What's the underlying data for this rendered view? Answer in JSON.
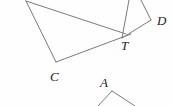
{
  "figure": {
    "width": 173,
    "height": 106,
    "background_color": "#fefefe",
    "stroke_color": "#7b7b7b",
    "label_color": "#1b1b1b",
    "stroke_width": 1,
    "labels": [
      {
        "id": "C",
        "text": "C",
        "x": 50,
        "y": 70
      },
      {
        "id": "T",
        "text": "T",
        "x": 121,
        "y": 39
      },
      {
        "id": "D",
        "text": "D",
        "x": 157,
        "y": 14
      },
      {
        "id": "A",
        "text": "A",
        "x": 100,
        "y": 76
      }
    ],
    "segments": [
      {
        "name": "apex-to-T",
        "x1": 26,
        "y1": 1,
        "x2": 126,
        "y2": 34
      },
      {
        "name": "apex-to-C",
        "x1": 26,
        "y1": 1,
        "x2": 56,
        "y2": 62
      },
      {
        "name": "C-to-T",
        "x1": 56,
        "y1": 62,
        "x2": 131,
        "y2": 34
      },
      {
        "name": "T-upward",
        "x1": 122,
        "y1": 38,
        "x2": 129,
        "y2": 0
      },
      {
        "name": "T-to-D",
        "x1": 122,
        "y1": 38,
        "x2": 151,
        "y2": 20
      },
      {
        "name": "D-upward",
        "x1": 151,
        "y1": 20,
        "x2": 141,
        "y2": 0
      },
      {
        "name": "A-left-leg",
        "x1": 112,
        "y1": 91,
        "x2": 98,
        "y2": 106
      },
      {
        "name": "A-right-leg",
        "x1": 112,
        "y1": 91,
        "x2": 135,
        "y2": 106
      }
    ]
  }
}
